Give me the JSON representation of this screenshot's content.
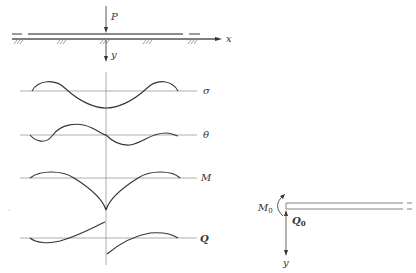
{
  "diagram": {
    "type": "beam on elastic foundation with internal force diagrams",
    "beam": {
      "load_label": "P",
      "x_axis_label": "x",
      "y_axis_label": "y"
    },
    "curves": [
      {
        "name": "sigma",
        "label": "σ"
      },
      {
        "name": "theta",
        "label": "θ"
      },
      {
        "name": "moment",
        "label": "M"
      },
      {
        "name": "shear",
        "label": "Q"
      }
    ],
    "semi_infinite_beam": {
      "moment_label": "M",
      "moment_sub": "0",
      "shear_label": "Q",
      "shear_sub": "0",
      "y_axis_label": "y"
    },
    "colors": {
      "line": "#333333",
      "baseline": "#999999"
    }
  }
}
